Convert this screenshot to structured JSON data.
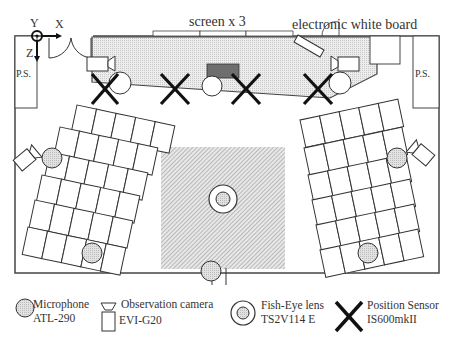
{
  "diagram": {
    "screen_label": "screen x 3",
    "whiteboard_label": "electronic white board",
    "axes": {
      "x": "X",
      "y": "Y",
      "z": "Z"
    },
    "power_supply_left": "P.S.",
    "power_supply_right": "P.S.",
    "colors": {
      "stage_fill": "#e4e4e4",
      "floor_hatch": "#9a9a9a",
      "microphone_fill": "#d6d6d6",
      "lectern_fill": "#6e6e6e",
      "line": "#333333"
    }
  },
  "legend": {
    "microphone": {
      "name": "Microphone",
      "model": "ATL-290"
    },
    "camera": {
      "name": "Observation camera",
      "model": "EVI-G20"
    },
    "fisheye": {
      "name": "Fish-Eye lens",
      "model": "TS2V114  E"
    },
    "position_sensor": {
      "name": "Position Sensor",
      "model": "IS600mkII"
    }
  }
}
